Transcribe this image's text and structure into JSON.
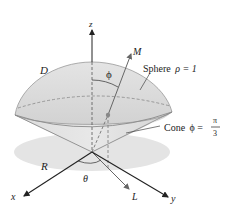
{
  "diagram": {
    "labels": {
      "z_axis": "z",
      "x_axis": "x",
      "y_axis": "y",
      "region_D": "D",
      "region_R": "R",
      "point_M": "M",
      "point_L": "L",
      "angle_phi": "ϕ",
      "angle_theta": "θ"
    },
    "annotations": {
      "sphere": {
        "word": "Sphere",
        "equation": "ρ = 1"
      },
      "cone": {
        "word": "Cone",
        "lhs": "ϕ =",
        "numerator": "π",
        "denominator": "3"
      }
    },
    "colors": {
      "solid_fill": "#d6d6d6",
      "solid_fill_light": "#e6e6e6",
      "shadow_fill": "#e3e3e3",
      "outline": "#8a8a8a",
      "axis": "#222222",
      "ray": "#777777"
    }
  }
}
